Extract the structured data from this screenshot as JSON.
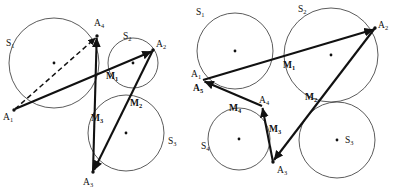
{
  "figure": {
    "background_color": "#ffffff",
    "stroke_color": "#111111",
    "circle_color": "#4a4a4a",
    "panels": [
      {
        "id": "left-panel",
        "name": "four-circle-construction",
        "circles": [
          {
            "label": "S1",
            "cx": 54,
            "cy": 63,
            "r": 45,
            "label_x": 6,
            "label_y": 45,
            "center_dot": true
          },
          {
            "label": "S2",
            "cx": 133,
            "cy": 63,
            "r": 25,
            "label_x": 123,
            "label_y": 38,
            "center_dot": true
          },
          {
            "label": "S3",
            "cx": 126,
            "cy": 133,
            "r": 38,
            "label_x": 168,
            "label_y": 143,
            "center_dot": true
          }
        ],
        "points": [
          {
            "label": "A1",
            "x": 14,
            "y": 110,
            "label_x": 3,
            "label_y": 119,
            "dot": true
          },
          {
            "label": "A2",
            "x": 153,
            "y": 50,
            "label_x": 156,
            "label_y": 46,
            "dot": true
          },
          {
            "label": "A3",
            "x": 93,
            "y": 172,
            "label_x": 84,
            "label_y": 184,
            "dot": true
          },
          {
            "label": "A4",
            "x": 97,
            "y": 36,
            "label_x": 96,
            "label_y": 26,
            "dot": true
          },
          {
            "label": "M1",
            "x": 112,
            "y": 70,
            "label_x": 108,
            "label_y": 79,
            "dot": false
          },
          {
            "label": "M2",
            "x": 131,
            "y": 97,
            "label_x": 131,
            "label_y": 106,
            "dot": false
          },
          {
            "label": "M3",
            "x": 100,
            "y": 112,
            "label_x": 94,
            "label_y": 121,
            "dot": false
          }
        ],
        "segments": [
          {
            "from": "A1",
            "to": "A2",
            "style": "solid",
            "arrow": true
          },
          {
            "from": "A2",
            "to": "A3",
            "style": "solid",
            "arrow": true
          },
          {
            "from": "A3",
            "to": "A4",
            "style": "solid",
            "arrow": true
          },
          {
            "from": "A1",
            "to": "A4",
            "style": "dashed",
            "arrow": true
          }
        ]
      },
      {
        "id": "right-panel",
        "name": "five-circle-construction",
        "circles": [
          {
            "label": "S1",
            "cx": 235,
            "cy": 51,
            "r": 38,
            "label_x": 197,
            "label_y": 14,
            "center_dot": true
          },
          {
            "label": "S2",
            "cx": 331,
            "cy": 55,
            "r": 47,
            "label_x": 299,
            "label_y": 11,
            "center_dot": true
          },
          {
            "label": "S3",
            "cx": 337,
            "cy": 140,
            "r": 38,
            "label_x": 345,
            "label_y": 142,
            "center_dot": true
          },
          {
            "label": "S4",
            "cx": 239,
            "cy": 139,
            "r": 31,
            "label_x": 202,
            "label_y": 148,
            "center_dot": true
          }
        ],
        "points": [
          {
            "label": "A1",
            "x": 203,
            "y": 80,
            "label_x": 192,
            "label_y": 76,
            "dot": false
          },
          {
            "label": "A5",
            "x": 203,
            "y": 80,
            "label_x": 194,
            "label_y": 90,
            "dot": false
          },
          {
            "label": "A2",
            "x": 375,
            "y": 28,
            "label_x": 378,
            "label_y": 27,
            "dot": true
          },
          {
            "label": "A3",
            "x": 273,
            "y": 162,
            "label_x": 277,
            "label_y": 172,
            "dot": true
          },
          {
            "label": "A4",
            "x": 262,
            "y": 106,
            "label_x": 261,
            "label_y": 105,
            "dot": false
          },
          {
            "label": "M1",
            "x": 288,
            "y": 59,
            "label_x": 285,
            "label_y": 68,
            "dot": false
          },
          {
            "label": "M2",
            "x": 313,
            "y": 104,
            "label_x": 307,
            "label_y": 99,
            "dot": false
          },
          {
            "label": "M3",
            "x": 269,
            "y": 132,
            "label_x": 270,
            "label_y": 131,
            "dot": false
          },
          {
            "label": "M4",
            "x": 240,
            "y": 104,
            "label_x": 231,
            "label_y": 110,
            "dot": false
          }
        ],
        "segments": [
          {
            "from": "A1",
            "to": "A2",
            "style": "solid",
            "arrow": true
          },
          {
            "from": "A2",
            "to": "A3",
            "style": "solid",
            "arrow": true
          },
          {
            "from": "A3",
            "to": "A4",
            "style": "solid",
            "arrow": true
          },
          {
            "from": "A4",
            "to": "A5",
            "style": "solid",
            "arrow": true
          }
        ]
      }
    ]
  },
  "labels": {
    "left": {
      "S1": "S",
      "S1_sub": "1",
      "S2": "S",
      "S2_sub": "2",
      "S3": "S",
      "S3_sub": "3",
      "A1": "A",
      "A1_sub": "1",
      "A2": "A",
      "A2_sub": "2",
      "A3": "A",
      "A3_sub": "3",
      "A4": "A",
      "A4_sub": "4",
      "M1": "M",
      "M1_sub": "1",
      "M2": "M",
      "M2_sub": "2",
      "M3": "M",
      "M3_sub": "3"
    },
    "right": {
      "S1": "S",
      "S1_sub": "1",
      "S2": "S",
      "S2_sub": "2",
      "S3": "S",
      "S3_sub": "3",
      "S4": "S",
      "S4_sub": "4",
      "A1": "A",
      "A1_sub": "1",
      "A2": "A",
      "A2_sub": "2",
      "A3": "A",
      "A3_sub": "3",
      "A4": "A",
      "A4_sub": "4",
      "A5": "A",
      "A5_sub": "5",
      "M1": "M",
      "M1_sub": "1",
      "M2": "M",
      "M2_sub": "2",
      "M3": "M",
      "M3_sub": "3",
      "M4": "M",
      "M4_sub": "4"
    }
  }
}
